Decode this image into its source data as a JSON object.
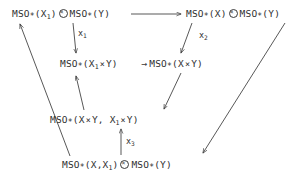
{
  "diagram": {
    "type": "commutative-diagram",
    "title": "",
    "background_color": "#ffffff",
    "ink_color": "#2f2f2f",
    "nodes": [
      {
        "id": "top-left",
        "text": "MSO_*(X_1) ⊗ MSO_*(Y)",
        "parts": {
          "base1": "MSO",
          "star1": "*",
          "arg1_open": "(X",
          "arg1_sub": "1",
          "arg1_close": ")",
          "tensor": "⊗",
          "base2": "MSO",
          "star2": "*",
          "arg2": "(Y)"
        }
      },
      {
        "id": "top-right",
        "text": "MSO_*(X) ⊗ MSO_*(Y)",
        "parts": {
          "base1": "MSO",
          "star1": "*",
          "arg1": "(X)",
          "tensor": "⊗",
          "base2": "MSO",
          "star2": "*",
          "arg2": "(Y)"
        }
      },
      {
        "id": "mid-left",
        "text": "MSO_*(X_1 × Y)",
        "parts": {
          "base": "MSO",
          "star": "*",
          "open": "(X",
          "sub": "1",
          "times": "×",
          "rest": "Y)"
        }
      },
      {
        "id": "mid-right",
        "text": "MSO_*(X × Y)",
        "parts": {
          "inline_arrow": "→",
          "base": "MSO",
          "star": "*",
          "open": "(X",
          "times": "×",
          "rest": "Y)"
        }
      },
      {
        "id": "row-four",
        "text": "MSO_*(X × Y, X_1 × Y)",
        "parts": {
          "base": "MSO",
          "star": "*",
          "open": "(X",
          "times1": "×",
          "mid": "Y, X",
          "sub": "1",
          "times2": "×",
          "rest": "Y)"
        }
      },
      {
        "id": "bottom",
        "text": "MSO_*(X,X_1) ⊗ MSO_*(Y)",
        "parts": {
          "base1": "MSO",
          "star1": "*",
          "open": "(X,X",
          "sub": "1",
          "close": ")",
          "tensor": "⊗",
          "base2": "MSO",
          "star2": "*",
          "arg2": "(Y)"
        }
      }
    ],
    "edge_labels": [
      {
        "id": "x1",
        "base": "x",
        "sub": "1"
      },
      {
        "id": "x2",
        "base": "x",
        "sub": "2"
      },
      {
        "id": "x3",
        "base": "x",
        "sub": "3"
      }
    ],
    "edges": [
      {
        "id": "top-horizontal",
        "from": "top-left",
        "to": "top-right",
        "style": "straight",
        "label": ""
      },
      {
        "id": "x1-edge",
        "from": "top-left",
        "to": "mid-left",
        "style": "straight",
        "label": "x1"
      },
      {
        "id": "x2-edge",
        "from": "top-right",
        "to": "mid-right",
        "style": "straight",
        "label": "x2"
      },
      {
        "id": "mid-inline",
        "from": "mid-left",
        "to": "mid-right",
        "style": "inline",
        "label": ""
      },
      {
        "id": "midright-to-rowfour",
        "from": "mid-right",
        "to": "row-four",
        "style": "straight",
        "label": ""
      },
      {
        "id": "rowfour-to-midleft",
        "from": "row-four",
        "to": "mid-left",
        "style": "straight",
        "label": ""
      },
      {
        "id": "x3-edge",
        "from": "bottom",
        "to": "row-four",
        "style": "straight",
        "label": "x3"
      },
      {
        "id": "bottom-to-topleft",
        "from": "bottom",
        "to": "top-left",
        "style": "straight",
        "label": ""
      },
      {
        "id": "topright-to-bottom",
        "from": "top-right",
        "to": "bottom",
        "style": "straight",
        "label": ""
      }
    ]
  }
}
